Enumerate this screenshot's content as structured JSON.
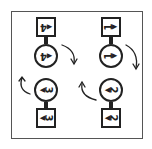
{
  "diagram": {
    "colors": {
      "stroke": "#222222",
      "frame": "#555555",
      "background": "#ffffff"
    },
    "orientation": "rotated-180",
    "columns": [
      {
        "id": "left",
        "nodes": [
          {
            "shape": "square",
            "label": "4",
            "pointer": "triangle"
          },
          {
            "shape": "circle",
            "label": "4",
            "pointer": "triangle"
          },
          {
            "shape": "circle",
            "label": "3",
            "pointer": "triangle"
          },
          {
            "shape": "square",
            "label": "3",
            "pointer": "triangle"
          }
        ],
        "arrows": [
          {
            "direction": "clockwise-down",
            "position": "right-upper"
          },
          {
            "direction": "counterclockwise-up",
            "position": "left-lower"
          }
        ]
      },
      {
        "id": "right",
        "nodes": [
          {
            "shape": "square",
            "label": "1",
            "pointer": "triangle"
          },
          {
            "shape": "circle",
            "label": "1",
            "pointer": "triangle"
          },
          {
            "shape": "circle",
            "label": "2",
            "pointer": "triangle"
          },
          {
            "shape": "square",
            "label": "2",
            "pointer": "triangle"
          }
        ],
        "arrows": [
          {
            "direction": "clockwise-down",
            "position": "right-upper"
          },
          {
            "direction": "counterclockwise-up",
            "position": "left-lower"
          }
        ]
      }
    ],
    "glyphs": {
      "triangle": "◀"
    }
  }
}
